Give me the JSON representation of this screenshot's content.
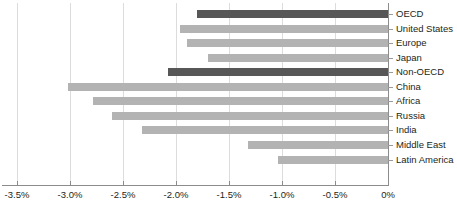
{
  "chart_data": {
    "type": "bar",
    "orientation": "horizontal",
    "title": "",
    "subtitle": "",
    "xlabel": "",
    "ylabel": "",
    "xlim": [
      -3.5,
      0
    ],
    "grid": true,
    "legend": "none",
    "x_tick_labels": [
      "-3.5%",
      "-3.0%",
      "-2.5%",
      "-2.0%",
      "-1.5%",
      "-1.0%",
      "-0.5%",
      "0%"
    ],
    "x_tick_values": [
      -3.5,
      -3.0,
      -2.5,
      -2.0,
      -1.5,
      -1.0,
      -0.5,
      0
    ],
    "categories": [
      "OECD",
      "United States",
      "Europe",
      "Japan",
      "Non-OECD",
      "China",
      "Africa",
      "Russia",
      "India",
      "Middle East",
      "Latin America"
    ],
    "values": [
      -1.8,
      -1.96,
      -1.9,
      -1.7,
      -2.08,
      -3.02,
      -2.78,
      -2.6,
      -2.32,
      -1.32,
      -1.04
    ],
    "highlighted": [
      true,
      false,
      false,
      false,
      true,
      false,
      false,
      false,
      false,
      false,
      false
    ],
    "colors": {
      "bar_default": "#b3b3b3",
      "bar_highlight": "#575757",
      "gridline": "#dcdcdc",
      "axis": "#8c8c8c",
      "text": "#231f20",
      "background": "#ffffff"
    }
  }
}
